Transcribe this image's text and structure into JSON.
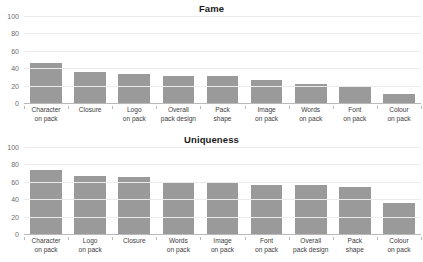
{
  "chart_data": [
    {
      "type": "bar",
      "title": "Fame",
      "xlabel": "",
      "ylabel": "",
      "ylim": [
        0,
        100
      ],
      "yticks": [
        0,
        20,
        40,
        60,
        80,
        100
      ],
      "grid": true,
      "legend": false,
      "bar_color": "#9a9a9a",
      "categories": [
        "Character on pack",
        "Closure",
        "Logo on pack",
        "Overall pack design",
        "Pack shape",
        "Image on pack",
        "Words on pack",
        "Font on pack",
        "Colour on pack"
      ],
      "category_lines": [
        [
          "Character",
          "on pack"
        ],
        [
          "Closure",
          ""
        ],
        [
          "Logo",
          "on pack"
        ],
        [
          "Overall",
          "pack design"
        ],
        [
          "Pack",
          "shape"
        ],
        [
          "Image",
          "on pack"
        ],
        [
          "Words",
          "on pack"
        ],
        [
          "Font",
          "on pack"
        ],
        [
          "Colour",
          "on pack"
        ]
      ],
      "values": [
        46,
        36,
        33,
        31,
        31,
        26,
        22,
        18,
        10
      ]
    },
    {
      "type": "bar",
      "title": "Uniqueness",
      "xlabel": "",
      "ylabel": "",
      "ylim": [
        0,
        100
      ],
      "yticks": [
        0,
        20,
        40,
        60,
        80,
        100
      ],
      "grid": true,
      "legend": false,
      "bar_color": "#9a9a9a",
      "categories": [
        "Character on pack",
        "Logo on pack",
        "Closure",
        "Words on pack",
        "Image on pack",
        "Font on pack",
        "Overall pack design",
        "Pack shape",
        "Colour on pack"
      ],
      "category_lines": [
        [
          "Character",
          "on pack"
        ],
        [
          "Logo",
          "on pack"
        ],
        [
          "Closure",
          ""
        ],
        [
          "Words",
          "on pack"
        ],
        [
          "Image",
          "on pack"
        ],
        [
          "Font",
          "on pack"
        ],
        [
          "Overall",
          "pack design"
        ],
        [
          "Pack",
          "shape"
        ],
        [
          "Colour",
          "on pack"
        ]
      ],
      "values": [
        74,
        67,
        65,
        59,
        59,
        56,
        56,
        54,
        36
      ]
    }
  ]
}
